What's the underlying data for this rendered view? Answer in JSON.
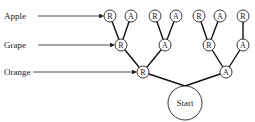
{
  "diagram": {
    "labels": [
      {
        "text": "Apple",
        "y": 16,
        "arrow_to": 103
      },
      {
        "text": "Grape",
        "y": 45,
        "arrow_to": 114
      },
      {
        "text": "Orange",
        "y": 72,
        "arrow_to": 136
      }
    ],
    "start_label": "Start",
    "levels": {
      "apple": [
        {
          "id": "a1",
          "label": "R",
          "x": 110,
          "y": 16
        },
        {
          "id": "a2",
          "label": "A",
          "x": 131,
          "y": 16
        },
        {
          "id": "a3",
          "label": "R",
          "x": 155,
          "y": 16
        },
        {
          "id": "a4",
          "label": "A",
          "x": 176,
          "y": 16
        },
        {
          "id": "a5",
          "label": "R",
          "x": 199,
          "y": 16
        },
        {
          "id": "a6",
          "label": "A",
          "x": 220,
          "y": 16
        },
        {
          "id": "a7",
          "label": "R",
          "x": 243,
          "y": 16
        }
      ],
      "grape": [
        {
          "id": "g1",
          "label": "R",
          "x": 121,
          "y": 45
        },
        {
          "id": "g2",
          "label": "A",
          "x": 165,
          "y": 45
        },
        {
          "id": "g3",
          "label": "R",
          "x": 209,
          "y": 45
        },
        {
          "id": "g4",
          "label": "A",
          "x": 243,
          "y": 45
        }
      ],
      "orange": [
        {
          "id": "o1",
          "label": "R",
          "x": 143,
          "y": 72
        },
        {
          "id": "o2",
          "label": "A",
          "x": 226,
          "y": 72
        }
      ]
    },
    "start": {
      "x": 185,
      "y": 103,
      "r": 17
    },
    "edges": [
      [
        "start",
        "o1"
      ],
      [
        "start",
        "o2"
      ],
      [
        "o1",
        "g1"
      ],
      [
        "o1",
        "g2"
      ],
      [
        "o2",
        "g3"
      ],
      [
        "o2",
        "g4"
      ],
      [
        "g1",
        "a1"
      ],
      [
        "g1",
        "a2"
      ],
      [
        "g2",
        "a3"
      ],
      [
        "g2",
        "a4"
      ],
      [
        "g3",
        "a5"
      ],
      [
        "g3",
        "a6"
      ],
      [
        "g4",
        "a7"
      ]
    ],
    "node_radius": 6
  }
}
